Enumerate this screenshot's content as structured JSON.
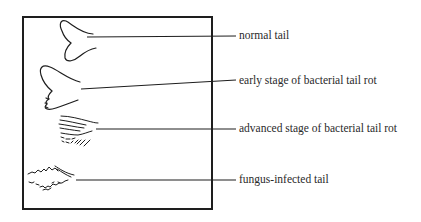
{
  "figure": {
    "labels": [
      {
        "id": "normal",
        "text": "normal tail"
      },
      {
        "id": "early",
        "text": "early stage of bacterial tail rot"
      },
      {
        "id": "advanced",
        "text": "advanced stage of bacterial tail rot"
      },
      {
        "id": "fungus",
        "text": "fungus-infected tail"
      }
    ],
    "colors": {
      "ink": "#1e1e1e",
      "background": "#ffffff"
    }
  }
}
